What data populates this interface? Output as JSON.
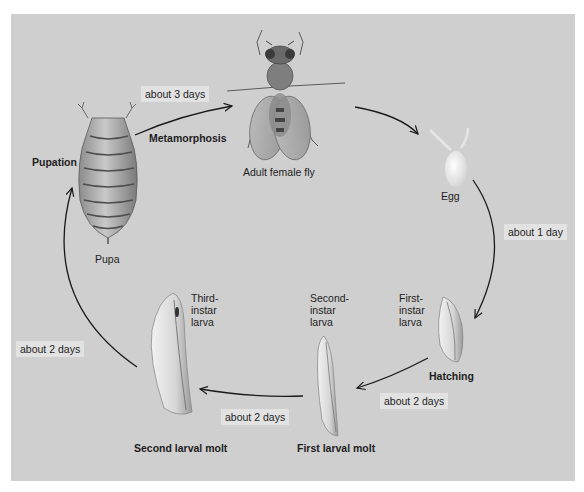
{
  "diagram": {
    "colors": {
      "background": "#cfcfcf",
      "time_label_bg": "#e2e2e2",
      "arrow": "#1a1a1a",
      "text": "#1e1e1e"
    },
    "stages": {
      "adult": "Adult female fly",
      "egg": "Egg",
      "first_instar": "First-\ninstar\nlarva",
      "second_instar": "Second-\ninstar\nlarva",
      "third_instar": "Third-\ninstar\nlarva",
      "pupa": "Pupa"
    },
    "events": {
      "metamorphosis": "Metamorphosis",
      "hatching": "Hatching",
      "first_molt": "First larval molt",
      "second_molt": "Second larval molt",
      "pupation": "Pupation"
    },
    "durations": {
      "pupa_to_adult": "about 3 days",
      "egg_to_larva": "about 1 day",
      "first_to_second": "about 2 days",
      "second_to_third": "about 2 days",
      "third_to_pupa": "about 2 days"
    }
  }
}
